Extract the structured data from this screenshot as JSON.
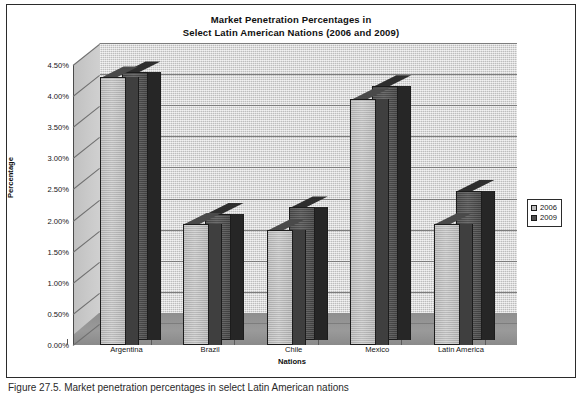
{
  "chart_data": {
    "type": "bar",
    "title": "Market Penetration Percentages in Select Latin American Nations (2006 and 2009)",
    "title_lines": [
      "Market Penetration Percentages in",
      "Select Latin American Nations (2006 and 2009)"
    ],
    "xlabel": "Nations",
    "ylabel": "Percentage",
    "categories": [
      "Argentina",
      "Brazil",
      "Chile",
      "Mexico",
      "Latin America"
    ],
    "series": [
      {
        "name": "2006",
        "values": [
          4.3,
          1.95,
          1.85,
          3.95,
          1.95
        ],
        "color": "#bdbdbd"
      },
      {
        "name": "2009",
        "values": [
          4.3,
          2.03,
          2.13,
          4.08,
          2.4
        ],
        "color": "#4f4f4f"
      }
    ],
    "ylim": [
      0.0,
      4.5
    ],
    "ytick_values": [
      0.0,
      0.5,
      1.0,
      1.5,
      2.0,
      2.5,
      3.0,
      3.5,
      4.0,
      4.5
    ],
    "ytick_labels": [
      "0.00%",
      "0.50%",
      "1.00%",
      "1.50%",
      "2.00%",
      "2.50%",
      "3.00%",
      "3.50%",
      "4.00%",
      "4.50%"
    ],
    "grid": true,
    "grid_axis": "y",
    "legend_position": "right",
    "three_d": true,
    "value_unit": "%"
  },
  "legend": {
    "entries": [
      {
        "label": "2006"
      },
      {
        "label": "2009"
      }
    ]
  },
  "caption": {
    "text": "Figure 27.5. Market penetration percentages in select Latin American nations"
  },
  "colors": {
    "plot_background": "#cdcdcd",
    "floor": "#919191",
    "frame_border": "#2b2b2b",
    "gridline": "#7d7d7d",
    "series_2006": "#bdbdbd",
    "series_2009": "#4f4f4f",
    "text": "#151515"
  }
}
